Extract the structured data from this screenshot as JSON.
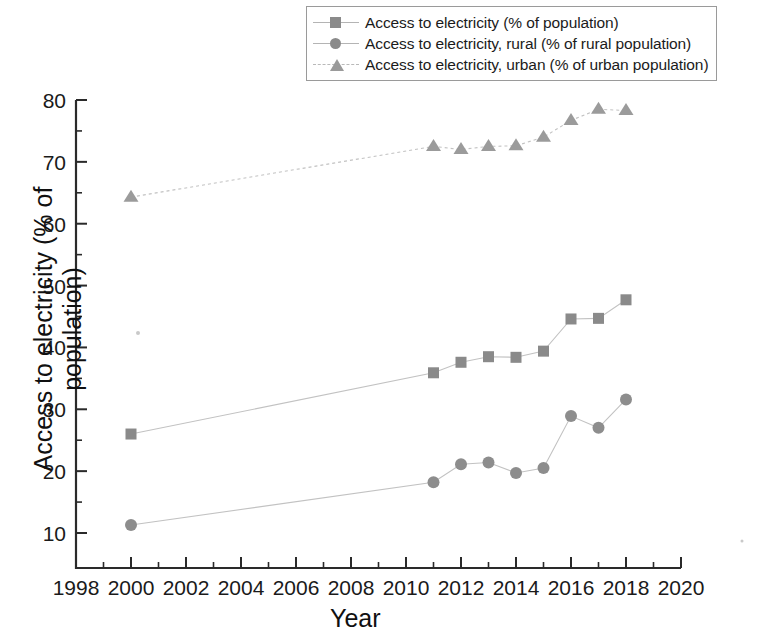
{
  "legend": {
    "position": "top-right",
    "entries": [
      {
        "label": "Access to electricity (% of population)",
        "marker": "square-marker",
        "color": "#8a8a8a"
      },
      {
        "label": "Access to electricity, rural (% of rural population)",
        "marker": "circle-marker",
        "color": "#8d8d8d"
      },
      {
        "label": "Access to electricity, urban (% of urban population)",
        "marker": "triangle-marker",
        "color": "#9b9b9b"
      }
    ]
  },
  "axes": {
    "x_title": "Year",
    "y_title": "Access to electricity (% of population)",
    "x_ticks": [
      "1998",
      "2000",
      "2002",
      "2004",
      "2006",
      "2008",
      "2010",
      "2012",
      "2014",
      "2016",
      "2018",
      "2020"
    ],
    "y_ticks": [
      "10",
      "20",
      "30",
      "40",
      "50",
      "60",
      "70",
      "80"
    ]
  },
  "chart_data": {
    "type": "line",
    "title": "",
    "xlabel": "Year",
    "ylabel": "Access to electricity (% of population)",
    "xlim": [
      1998,
      2020
    ],
    "ylim": [
      7,
      81
    ],
    "xticks": [
      1998,
      2000,
      2002,
      2004,
      2006,
      2008,
      2010,
      2012,
      2014,
      2016,
      2018,
      2020
    ],
    "yticks": [
      10,
      20,
      30,
      40,
      50,
      60,
      70,
      80
    ],
    "minor_ticks": true,
    "grid": false,
    "legend_position": "top-right",
    "x": [
      2000,
      2011,
      2012,
      2013,
      2014,
      2015,
      2016,
      2017,
      2018
    ],
    "series": [
      {
        "name": "Access to electricity (% of population)",
        "marker": "square",
        "color": "#8a8a8a",
        "linestyle": "solid",
        "values": [
          26.0,
          35.9,
          37.6,
          38.5,
          38.4,
          39.4,
          44.6,
          44.7,
          47.7
        ]
      },
      {
        "name": "Access to electricity, rural (% of rural population)",
        "marker": "circle",
        "color": "#8d8d8d",
        "linestyle": "solid",
        "values": [
          11.3,
          18.2,
          21.1,
          21.4,
          19.7,
          20.5,
          28.9,
          27.0,
          31.6
        ]
      },
      {
        "name": "Access to electricity, urban (% of urban population)",
        "marker": "triangle",
        "color": "#9b9b9b",
        "linestyle": "dashed",
        "values": [
          64.3,
          72.5,
          72.0,
          72.5,
          72.6,
          74.0,
          76.7,
          78.5,
          78.3
        ]
      }
    ]
  }
}
